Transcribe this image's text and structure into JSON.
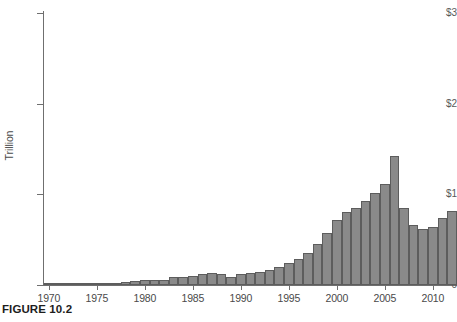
{
  "figure": {
    "caption": "FIGURE 10.2"
  },
  "chart_data": {
    "type": "bar",
    "title": "",
    "subtitle": "",
    "xlabel": "",
    "ylabel": "Trillion",
    "ylim": [
      0,
      3
    ],
    "xlim": [
      1969.5,
      2012.5
    ],
    "grid": false,
    "legend": null,
    "y_tick_labels": [
      "0",
      "$1",
      "$2",
      "$3"
    ],
    "y_tick_values": [
      0,
      1,
      2,
      3
    ],
    "x_tick_labels": [
      "1970",
      "1975",
      "1980",
      "1985",
      "1990",
      "1995",
      "2000",
      "2005",
      "2010"
    ],
    "x_tick_values": [
      1970,
      1975,
      1980,
      1985,
      1990,
      1995,
      2000,
      2005,
      2010
    ],
    "units": "Trillion dollars",
    "bar_color": "#8a8a8a",
    "bar_edge_color": "#5d5d5d",
    "axis_color": "#6f6f6f",
    "categories": [
      "1970",
      "1971",
      "1972",
      "1973",
      "1974",
      "1975",
      "1976",
      "1977",
      "1978",
      "1979",
      "1980",
      "1981",
      "1982",
      "1983",
      "1984",
      "1985",
      "1986",
      "1987",
      "1988",
      "1989",
      "1990",
      "1991",
      "1992",
      "1993",
      "1994",
      "1995",
      "1996",
      "1997",
      "1998",
      "1999",
      "2000",
      "2001",
      "2002",
      "2003",
      "2004",
      "2005",
      "2006",
      "2007",
      "2008",
      "2009",
      "2010",
      "2011",
      "2012"
    ],
    "values": [
      0.01,
      0.01,
      0.01,
      0.01,
      0.01,
      0.01,
      0.02,
      0.02,
      0.03,
      0.04,
      0.05,
      0.05,
      0.06,
      0.09,
      0.09,
      0.1,
      0.12,
      0.13,
      0.12,
      0.09,
      0.12,
      0.13,
      0.14,
      0.17,
      0.2,
      0.24,
      0.29,
      0.35,
      0.45,
      0.57,
      0.72,
      0.8,
      0.85,
      0.93,
      1.02,
      1.11,
      1.42,
      0.85,
      0.66,
      0.62,
      0.64,
      0.74,
      0.82
    ]
  }
}
